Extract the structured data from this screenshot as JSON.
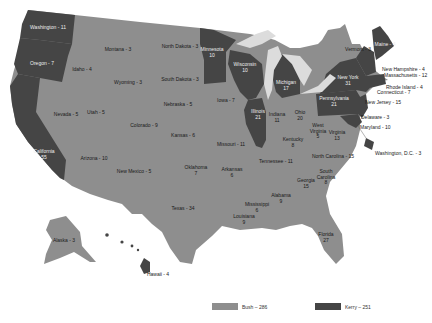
{
  "colors": {
    "bush": "#8e8e8e",
    "kerry": "#454545",
    "water": "#dcdcdc",
    "background": "#ffffff",
    "border": "#b5b5b5"
  },
  "legend": {
    "bush": {
      "label": "Bush – 286"
    },
    "kerry": {
      "label": "Kerry – 251"
    }
  },
  "states": {
    "washington": {
      "name": "Washington",
      "votes": "11",
      "winner": "Kerry",
      "label": "Washington - 11"
    },
    "oregon": {
      "name": "Oregon",
      "votes": "7",
      "winner": "Kerry",
      "label": "Oregon - 7"
    },
    "california": {
      "name": "California",
      "votes": "55",
      "winner": "Kerry",
      "label": "California",
      "sub": "55"
    },
    "idaho": {
      "name": "Idaho",
      "votes": "4",
      "winner": "Bush",
      "label": "Idaho - 4"
    },
    "nevada": {
      "name": "Nevada",
      "votes": "5",
      "winner": "Bush",
      "label": "Nevada - 5"
    },
    "utah": {
      "name": "Utah",
      "votes": "5",
      "winner": "Bush",
      "label": "Utah - 5"
    },
    "arizona": {
      "name": "Arizona",
      "votes": "10",
      "winner": "Bush",
      "label": "Arizona - 10"
    },
    "montana": {
      "name": "Montana",
      "votes": "3",
      "winner": "Bush",
      "label": "Montana - 3"
    },
    "wyoming": {
      "name": "Wyoming",
      "votes": "3",
      "winner": "Bush",
      "label": "Wyoming - 3"
    },
    "colorado": {
      "name": "Colorado",
      "votes": "9",
      "winner": "Bush",
      "label": "Colorado - 9"
    },
    "new_mexico": {
      "name": "New Mexico",
      "votes": "5",
      "winner": "Bush",
      "label": "New Mexico - 5"
    },
    "north_dakota": {
      "name": "North Dakota",
      "votes": "3",
      "winner": "Bush",
      "label": "North Dakota - 3"
    },
    "south_dakota": {
      "name": "South Dakota",
      "votes": "3",
      "winner": "Bush",
      "label": "South Dakota - 3"
    },
    "nebraska": {
      "name": "Nebraska",
      "votes": "5",
      "winner": "Bush",
      "label": "Nebraska - 5"
    },
    "kansas": {
      "name": "Kansas",
      "votes": "6",
      "winner": "Bush",
      "label": "Kansas - 6"
    },
    "oklahoma": {
      "name": "Oklahoma",
      "votes": "7",
      "winner": "Bush",
      "label": "Oklahoma",
      "sub": "7"
    },
    "texas": {
      "name": "Texas",
      "votes": "34",
      "winner": "Bush",
      "label": "Texas - 34"
    },
    "minnesota": {
      "name": "Minnesota",
      "votes": "10",
      "winner": "Kerry",
      "label": "Minnesota",
      "sub": "10"
    },
    "iowa": {
      "name": "Iowa",
      "votes": "7",
      "winner": "Bush",
      "label": "Iowa - 7"
    },
    "missouri": {
      "name": "Missouri",
      "votes": "11",
      "winner": "Bush",
      "label": "Missouri - 11"
    },
    "arkansas": {
      "name": "Arkansas",
      "votes": "6",
      "winner": "Bush",
      "label": "Arkansas",
      "sub": "6"
    },
    "louisiana": {
      "name": "Louisiana",
      "votes": "9",
      "winner": "Bush",
      "label": "Louisiana",
      "sub": "9"
    },
    "wisconsin": {
      "name": "Wisconsin",
      "votes": "10",
      "winner": "Kerry",
      "label": "Wisconsin",
      "sub": "10"
    },
    "illinois": {
      "name": "Illinois",
      "votes": "21",
      "winner": "Kerry",
      "label": "Illinois",
      "sub": "21"
    },
    "michigan": {
      "name": "Michigan",
      "votes": "17",
      "winner": "Kerry",
      "label": "Michigan",
      "sub": "17"
    },
    "indiana": {
      "name": "Indiana",
      "votes": "11",
      "winner": "Bush",
      "label": "Indiana",
      "sub": "11"
    },
    "ohio": {
      "name": "Ohio",
      "votes": "20",
      "winner": "Bush",
      "label": "Ohio",
      "sub": "20"
    },
    "kentucky": {
      "name": "Kentucky",
      "votes": "8",
      "winner": "Bush",
      "label": "Kentucky",
      "sub": "8"
    },
    "tennessee": {
      "name": "Tennessee",
      "votes": "11",
      "winner": "Bush",
      "label": "Tennessee - 11"
    },
    "mississippi": {
      "name": "Mississippi",
      "votes": "6",
      "winner": "Bush",
      "label": "Mississippi",
      "sub": "6"
    },
    "alabama": {
      "name": "Alabama",
      "votes": "9",
      "winner": "Bush",
      "label": "Alabama",
      "sub": "9"
    },
    "georgia": {
      "name": "Georgia",
      "votes": "15",
      "winner": "Bush",
      "label": "Georgia",
      "sub": "15"
    },
    "florida": {
      "name": "Florida",
      "votes": "27",
      "winner": "Bush",
      "label": "Florida",
      "sub": "27"
    },
    "south_carolina": {
      "name": "South Carolina",
      "votes": "8",
      "winner": "Bush",
      "label": "South",
      "label2": "Carolina",
      "sub": "8"
    },
    "north_carolina": {
      "name": "North Carolina",
      "votes": "15",
      "winner": "Bush",
      "label": "North Carolina - 15"
    },
    "virginia": {
      "name": "Virginia",
      "votes": "13",
      "winner": "Bush",
      "label": "Virginia",
      "sub": "13"
    },
    "west_virginia": {
      "name": "West Virginia",
      "votes": "5",
      "winner": "Bush",
      "label": "West",
      "label2": "Virginia",
      "sub": "5"
    },
    "pennsylvania": {
      "name": "Pennsylvania",
      "votes": "21",
      "winner": "Kerry",
      "label": "Pennsylvania",
      "sub": "21"
    },
    "new_york": {
      "name": "New York",
      "votes": "31",
      "winner": "Kerry",
      "label": "New York",
      "sub": "31"
    },
    "vermont": {
      "name": "Vermont",
      "votes": "3",
      "winner": "Kerry",
      "label": "Vermont - 3"
    },
    "maine": {
      "name": "Maine",
      "votes": "4",
      "winner": "Kerry",
      "label": "Maine - 4"
    },
    "new_hampshire": {
      "name": "New Hampshire",
      "votes": "4",
      "winner": "Kerry",
      "label": "New Hampshire - 4"
    },
    "massachusetts": {
      "name": "Massachusetts",
      "votes": "12",
      "winner": "Kerry",
      "label": "Massachusetts - 12"
    },
    "rhode_island": {
      "name": "Rhode Island",
      "votes": "4",
      "winner": "Kerry",
      "label": "Rhode Island - 4"
    },
    "connecticut": {
      "name": "Connecticut",
      "votes": "7",
      "winner": "Kerry",
      "label": "Connecticut - 7"
    },
    "new_jersey": {
      "name": "New Jersey",
      "votes": "15",
      "winner": "Kerry",
      "label": "New Jersey - 15"
    },
    "delaware": {
      "name": "Delaware",
      "votes": "3",
      "winner": "Kerry",
      "label": "Delaware - 3"
    },
    "maryland": {
      "name": "Maryland",
      "votes": "10",
      "winner": "Kerry",
      "label": "Maryland - 10"
    },
    "dc": {
      "name": "Washington, D.C.",
      "votes": "3",
      "winner": "Kerry",
      "label": "Washington, D.C. - 3"
    },
    "alaska": {
      "name": "Alaska",
      "votes": "3",
      "winner": "Bush",
      "label": "Alaska - 3"
    },
    "hawaii": {
      "name": "Hawaii",
      "votes": "4",
      "winner": "Kerry",
      "label": "Hawaii - 4"
    }
  }
}
